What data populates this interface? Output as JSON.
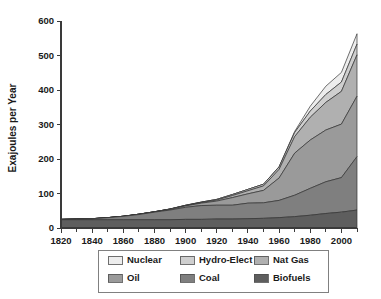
{
  "chart_data": {
    "type": "area",
    "stacked": true,
    "title": "",
    "subtitle": "",
    "xlabel": "",
    "ylabel": "Exajoules per Year",
    "xlim": [
      1820,
      2010
    ],
    "ylim": [
      0,
      600
    ],
    "grid": false,
    "legend_position": "bottom",
    "x_major_ticks": [
      1820,
      1840,
      1860,
      1880,
      1900,
      1920,
      1940,
      1960,
      1980,
      2000
    ],
    "x_minor_tick_step": 10,
    "y_ticks": [
      0,
      100,
      200,
      300,
      400,
      500,
      600
    ],
    "x": [
      1820,
      1830,
      1840,
      1850,
      1860,
      1870,
      1880,
      1890,
      1900,
      1910,
      1920,
      1930,
      1940,
      1950,
      1960,
      1970,
      1980,
      1990,
      2000,
      2010
    ],
    "stack_order_bottom_to_top": [
      "Biofuels",
      "Coal",
      "Oil",
      "Nat Gas",
      "Hydro-Elect",
      "Nuclear"
    ],
    "series": [
      {
        "name": "Nuclear",
        "color": "#ededed",
        "values": [
          0,
          0,
          0,
          0,
          0,
          0,
          0,
          0,
          0,
          0,
          0,
          0,
          0,
          0,
          1,
          3,
          14,
          24,
          28,
          30
        ]
      },
      {
        "name": "Hydro-Elect",
        "color": "#cfcfcf",
        "values": [
          0,
          0,
          0,
          0,
          0,
          0,
          0,
          0,
          1,
          1,
          2,
          3,
          4,
          5,
          7,
          12,
          18,
          23,
          27,
          31
        ]
      },
      {
        "name": "Nat Gas",
        "color": "#b0b0b0",
        "values": [
          0,
          0,
          0,
          0,
          0,
          0,
          0,
          1,
          1,
          2,
          3,
          6,
          9,
          13,
          25,
          48,
          66,
          80,
          95,
          120
        ]
      },
      {
        "name": "Oil",
        "color": "#9a9a9a",
        "values": [
          0,
          0,
          0,
          0,
          0,
          1,
          1,
          2,
          4,
          7,
          12,
          22,
          27,
          36,
          65,
          122,
          140,
          150,
          155,
          175
        ]
      },
      {
        "name": "Coal",
        "color": "#7f7f7f",
        "values": [
          1,
          2,
          3,
          6,
          10,
          15,
          22,
          28,
          35,
          40,
          40,
          40,
          45,
          45,
          50,
          62,
          78,
          92,
          100,
          155
        ]
      },
      {
        "name": "Biofuels",
        "color": "#5e5e5e",
        "values": [
          24,
          24,
          24,
          24,
          24,
          24,
          24,
          24,
          25,
          25,
          26,
          26,
          27,
          28,
          30,
          33,
          37,
          42,
          46,
          52
        ]
      }
    ],
    "totals": [
      25,
      26,
      27,
      30,
      34,
      40,
      47,
      55,
      66,
      75,
      83,
      97,
      112,
      127,
      178,
      280,
      353,
      411,
      451,
      563
    ],
    "peak_total": 563,
    "peak_year": 2010
  },
  "legend": {
    "items": [
      {
        "label": "Nuclear",
        "color": "#ededed"
      },
      {
        "label": "Hydro-Elect",
        "color": "#cfcfcf"
      },
      {
        "label": "Nat Gas",
        "color": "#b0b0b0"
      },
      {
        "label": "Oil",
        "color": "#9a9a9a"
      },
      {
        "label": "Coal",
        "color": "#7f7f7f"
      },
      {
        "label": "Biofuels",
        "color": "#5e5e5e"
      }
    ]
  },
  "axes": {
    "y_title": "Exajoules per Year",
    "y_tick_labels": [
      "0",
      "100",
      "200",
      "300",
      "400",
      "500",
      "600"
    ],
    "x_tick_labels": [
      "1820",
      "1840",
      "1860",
      "1880",
      "1900",
      "1920",
      "1940",
      "1960",
      "1980",
      "2000"
    ]
  }
}
